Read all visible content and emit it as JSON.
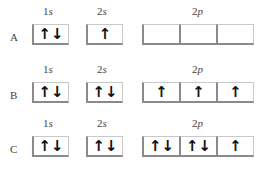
{
  "rows": [
    {
      "label": "A",
      "orbitals": {
        "s1": {
          "label_num": "1",
          "label_sub": "s",
          "boxes": [
            "↑↓"
          ]
        },
        "s2": {
          "label_num": "2",
          "label_sub": "s",
          "boxes": [
            "↑"
          ]
        },
        "p2": {
          "label_num": "2",
          "label_sub": "p",
          "boxes": [
            "",
            "",
            ""
          ]
        }
      }
    },
    {
      "label": "B",
      "orbitals": {
        "s1": {
          "label_num": "1",
          "label_sub": "s",
          "boxes": [
            "↑↓"
          ]
        },
        "s2": {
          "label_num": "2",
          "label_sub": "s",
          "boxes": [
            "↑↓"
          ]
        },
        "p2": {
          "label_num": "2",
          "label_sub": "p",
          "boxes": [
            "↑",
            "↑",
            "↑"
          ]
        }
      }
    },
    {
      "label": "C",
      "orbitals": {
        "s1": {
          "label_num": "1",
          "label_sub": "s",
          "boxes": [
            "↑↓"
          ]
        },
        "s2": {
          "label_num": "2",
          "label_sub": "s",
          "boxes": [
            "↑↓"
          ]
        },
        "p2": {
          "label_num": "2",
          "label_sub": "p",
          "boxes": [
            "↑↓",
            "↑↓",
            "↑"
          ]
        }
      }
    }
  ]
}
